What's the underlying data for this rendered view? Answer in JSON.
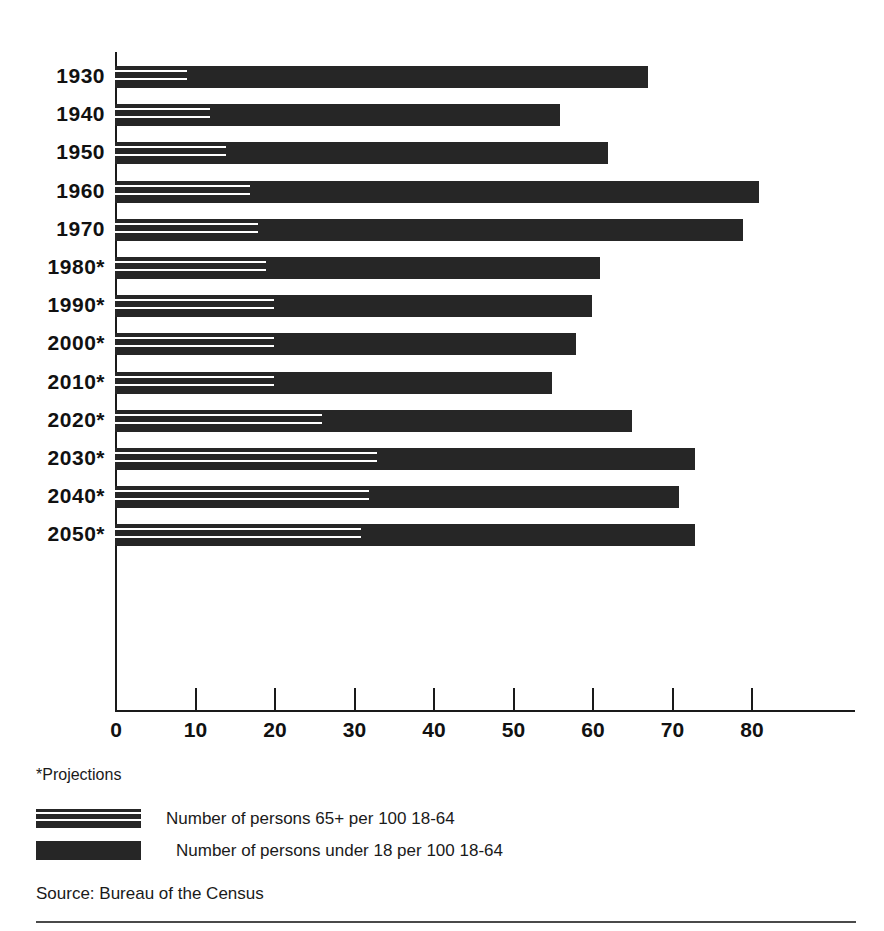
{
  "footnote": "*Projections",
  "source": "Source: Bureau of the Census",
  "legend": [
    {
      "key": "hatched",
      "label": "Number of persons 65+ per 100 18-64"
    },
    {
      "key": "solid",
      "label": "Number of persons under 18 per 100 18-64"
    }
  ],
  "axis": {
    "ticks": [
      0,
      10,
      20,
      30,
      40,
      50,
      60,
      70,
      80
    ],
    "tick_labels": [
      "0",
      "10",
      "20",
      "30",
      "40",
      "50",
      "60",
      "70",
      "80"
    ],
    "xlim": [
      0,
      100
    ],
    "px_per_unit": 7.95,
    "origin_px": 0
  },
  "chart_data": {
    "type": "bar",
    "orientation": "horizontal",
    "stacked": true,
    "title": "",
    "subtitle": "",
    "xlabel": "",
    "ylabel": "",
    "xlim": [
      0,
      100
    ],
    "grid": false,
    "legend_position": "bottom",
    "annotations": [
      "*Projections",
      "Source: Bureau of the Census"
    ],
    "categories": [
      "1930",
      "1940",
      "1950",
      "1960",
      "1970",
      "1980*",
      "1990*",
      "2000*",
      "2010*",
      "2020*",
      "2030*",
      "2040*",
      "2050*"
    ],
    "series": [
      {
        "name": "Number of persons 65+ per 100 18-64",
        "pattern": "hatched",
        "values": [
          9,
          12,
          14,
          17,
          18,
          19,
          20,
          20,
          20,
          26,
          33,
          32,
          31
        ]
      },
      {
        "name": "Number of persons under 18 per 100 18-64",
        "pattern": "solid",
        "values": [
          58,
          44,
          48,
          64,
          61,
          42,
          40,
          38,
          35,
          39,
          40,
          39,
          42
        ]
      }
    ],
    "totals": [
      67,
      56,
      62,
      81,
      79,
      61,
      60,
      58,
      55,
      65,
      73,
      71,
      73
    ],
    "rows": [
      {
        "category": "1930",
        "elderly": 9,
        "youth": 58,
        "total": 67,
        "projection": false
      },
      {
        "category": "1940",
        "elderly": 12,
        "youth": 44,
        "total": 56,
        "projection": false
      },
      {
        "category": "1950",
        "elderly": 14,
        "youth": 48,
        "total": 62,
        "projection": false
      },
      {
        "category": "1960",
        "elderly": 17,
        "youth": 64,
        "total": 81,
        "projection": false
      },
      {
        "category": "1970",
        "elderly": 18,
        "youth": 61,
        "total": 79,
        "projection": false
      },
      {
        "category": "1980*",
        "elderly": 19,
        "youth": 42,
        "total": 61,
        "projection": true
      },
      {
        "category": "1990*",
        "elderly": 20,
        "youth": 40,
        "total": 60,
        "projection": true
      },
      {
        "category": "2000*",
        "elderly": 20,
        "youth": 38,
        "total": 58,
        "projection": true
      },
      {
        "category": "2010*",
        "elderly": 20,
        "youth": 35,
        "total": 55,
        "projection": true
      },
      {
        "category": "2020*",
        "elderly": 26,
        "youth": 39,
        "total": 65,
        "projection": true
      },
      {
        "category": "2030*",
        "elderly": 33,
        "youth": 40,
        "total": 73,
        "projection": true
      },
      {
        "category": "2040*",
        "elderly": 32,
        "youth": 39,
        "total": 71,
        "projection": true
      },
      {
        "category": "2050*",
        "elderly": 31,
        "youth": 42,
        "total": 73,
        "projection": true
      }
    ]
  },
  "colors": {
    "bar": "#262626",
    "axis": "#1a1a1a",
    "background": "#ffffff",
    "text": "#1a1a1a"
  }
}
